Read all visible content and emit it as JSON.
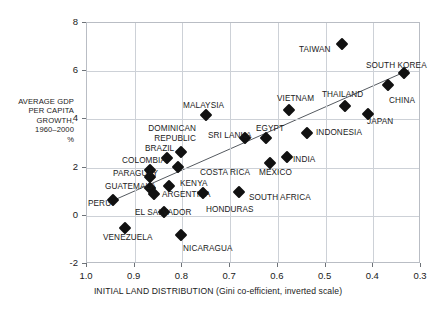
{
  "figure": {
    "title_strip": "",
    "axis_title_y_lines": [
      "AVERAGE GDP",
      "PER CAPITA",
      "GROWTH,",
      "1960–2000",
      "%"
    ],
    "axis_title_x": "INITIAL LAND DISTRIBUTION (Gini co-efficient, inverted scale)"
  },
  "chart_data": {
    "type": "scatter",
    "title": "",
    "xlabel": "INITIAL LAND DISTRIBUTION (Gini co-efficient, inverted scale)",
    "ylabel": "AVERAGE GDP PER CAPITA GROWTH, 1960–2000 %",
    "xlim": [
      1.0,
      0.3
    ],
    "ylim": [
      -2,
      8
    ],
    "x_inverted": true,
    "grid": true,
    "legend": "none",
    "xticks": [
      "1.0",
      "0.9",
      "0.8",
      "0.7",
      "0.6",
      "0.5",
      "0.4",
      "0.3"
    ],
    "xtick_values": [
      1.0,
      0.9,
      0.8,
      0.7,
      0.6,
      0.5,
      0.4,
      0.3
    ],
    "yticks": [
      "8",
      "6",
      "4",
      "2",
      "0",
      "-2"
    ],
    "ytick_values": [
      8,
      6,
      4,
      2,
      0,
      -2
    ],
    "trendline": {
      "x0": 0.955,
      "y0": 0.55,
      "x1": 0.325,
      "y1": 6.05
    },
    "points": [
      {
        "name": "TAIWAN",
        "x": 0.463,
        "y": 7.1,
        "lx": 299,
        "ly": 45,
        "anchor": "left"
      },
      {
        "name": "SOUTH KOREA",
        "x": 0.333,
        "y": 5.9,
        "lx": 366,
        "ly": 61,
        "anchor": "left"
      },
      {
        "name": "CHINA",
        "x": 0.367,
        "y": 5.4,
        "lx": 389,
        "ly": 96,
        "anchor": "left"
      },
      {
        "name": "THAILAND",
        "x": 0.457,
        "y": 4.5,
        "lx": 322,
        "ly": 90,
        "anchor": "left"
      },
      {
        "name": "JAPAN",
        "x": 0.409,
        "y": 4.2,
        "lx": 367,
        "ly": 117,
        "anchor": "left"
      },
      {
        "name": "VIETNAM",
        "x": 0.574,
        "y": 4.35,
        "lx": 277,
        "ly": 94,
        "anchor": "left"
      },
      {
        "name": "MALAYSIA",
        "x": 0.748,
        "y": 4.15,
        "lx": 183,
        "ly": 101,
        "anchor": "left"
      },
      {
        "name": "INDONESIA",
        "x": 0.536,
        "y": 3.4,
        "lx": 316,
        "ly": 128,
        "anchor": "left"
      },
      {
        "name": "EGYPT",
        "x": 0.622,
        "y": 3.2,
        "lx": 256,
        "ly": 124,
        "anchor": "left"
      },
      {
        "name": "SRI LANKA",
        "x": 0.667,
        "y": 3.2,
        "lx": 208,
        "ly": 131,
        "anchor": "left"
      },
      {
        "name": "DOMINICAN REPUBLIC",
        "x": 0.8,
        "y": 2.6,
        "lx": 140,
        "ly": 124,
        "anchor": "right2"
      },
      {
        "name": "BRAZIL",
        "x": 0.83,
        "y": 2.35,
        "lx": 145,
        "ly": 144,
        "anchor": "left"
      },
      {
        "name": "INDIA",
        "x": 0.578,
        "y": 2.4,
        "lx": 293,
        "ly": 155,
        "anchor": "left"
      },
      {
        "name": "MEXICO",
        "x": 0.615,
        "y": 2.15,
        "lx": 259,
        "ly": 168,
        "anchor": "left"
      },
      {
        "name": "COSTA RICA",
        "x": 0.808,
        "y": 2.0,
        "lx": 200,
        "ly": 168,
        "anchor": "left"
      },
      {
        "name": "COLOMBIA",
        "x": 0.866,
        "y": 1.85,
        "lx": 122,
        "ly": 156,
        "anchor": "left"
      },
      {
        "name": "PARAGUAY",
        "x": 0.866,
        "y": 1.55,
        "lx": 113,
        "ly": 169,
        "anchor": "left"
      },
      {
        "name": "GUATEMALA",
        "x": 0.866,
        "y": 1.1,
        "lx": 105,
        "ly": 182,
        "anchor": "left"
      },
      {
        "name": "KENYA",
        "x": 0.826,
        "y": 1.2,
        "lx": 180,
        "ly": 179,
        "anchor": "left"
      },
      {
        "name": "SOUTH AFRICA",
        "x": 0.68,
        "y": 0.95,
        "lx": 249,
        "ly": 193,
        "anchor": "left"
      },
      {
        "name": "ARGENTINA",
        "x": 0.858,
        "y": 0.85,
        "lx": 162,
        "ly": 190,
        "anchor": "left"
      },
      {
        "name": "HONDURAS",
        "x": 0.755,
        "y": 0.9,
        "lx": 206,
        "ly": 205,
        "anchor": "left"
      },
      {
        "name": "PERU",
        "x": 0.943,
        "y": 0.6,
        "lx": 88,
        "ly": 199,
        "anchor": "left"
      },
      {
        "name": "EL SALVADOR",
        "x": 0.836,
        "y": 0.1,
        "lx": 135,
        "ly": 208,
        "anchor": "left"
      },
      {
        "name": "VENEZUELA",
        "x": 0.918,
        "y": -0.55,
        "lx": 103,
        "ly": 233,
        "anchor": "left"
      },
      {
        "name": "NICARAGUA",
        "x": 0.8,
        "y": -0.85,
        "lx": 183,
        "ly": 244,
        "anchor": "left"
      }
    ]
  }
}
